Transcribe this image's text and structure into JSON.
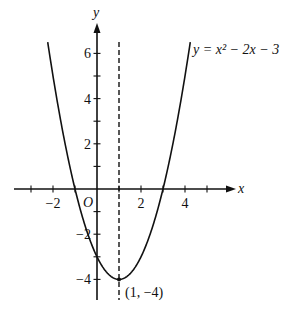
{
  "chart_data": {
    "type": "line",
    "title": "",
    "equation_label": "y = x² − 2x − 3",
    "equation": {
      "a": 1,
      "b": -2,
      "c": -3
    },
    "xlabel": "x",
    "ylabel": "y",
    "origin_label": "O",
    "xlim": [
      -3.8,
      6.3
    ],
    "ylim": [
      -5,
      7.5
    ],
    "x_ticks": [
      -3,
      -2,
      -1,
      1,
      2,
      3,
      4,
      5
    ],
    "x_tick_labels": [
      {
        "value": -2,
        "label": "−2"
      },
      {
        "value": 2,
        "label": "2"
      },
      {
        "value": 4,
        "label": "4"
      }
    ],
    "y_ticks": [
      -4,
      -3,
      -2,
      -1,
      1,
      2,
      3,
      4,
      5,
      6
    ],
    "y_tick_labels": [
      {
        "value": 6,
        "label": "6"
      },
      {
        "value": 4,
        "label": "4"
      },
      {
        "value": 2,
        "label": "2"
      },
      {
        "value": -2,
        "label": "−2"
      },
      {
        "value": -4,
        "label": "−4"
      }
    ],
    "axis_of_symmetry": {
      "x": 1,
      "style": "dashed"
    },
    "vertex": {
      "x": 1,
      "y": -4,
      "label": "(1, −4)"
    },
    "roots": [
      -1,
      3
    ],
    "y_intercept": -3,
    "curve_y_max": 6.5,
    "grid": false
  }
}
